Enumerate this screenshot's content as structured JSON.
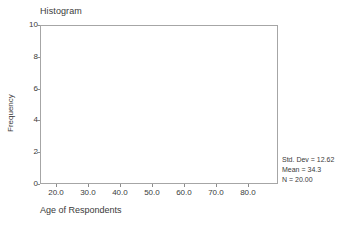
{
  "chart_data": {
    "type": "bar",
    "title": "Histogram",
    "xlabel": "Age of Respondents",
    "ylabel": "Frequency",
    "xlim": [
      15.0,
      89.4
    ],
    "ylim": [
      0,
      10
    ],
    "grid": false,
    "legend": null,
    "x_ticks": [
      "20.0",
      "30.0",
      "40.0",
      "50.0",
      "60.0",
      "70.0",
      "80.0"
    ],
    "x_tick_values": [
      20.0,
      30.0,
      40.0,
      50.0,
      60.0,
      70.0,
      80.0
    ],
    "y_ticks": [
      "0",
      "2",
      "4",
      "6",
      "8",
      "10"
    ],
    "y_tick_values": [
      0,
      2,
      4,
      6,
      8,
      10
    ],
    "categories": [],
    "values": [],
    "annotations": [
      "Std. Dev = 12.62",
      "Mean = 34.3",
      "N = 20.00"
    ]
  },
  "statistics": {
    "std_dev_label": "Std. Dev = 12.62",
    "mean_label": "Mean = 34.3",
    "n_label": "N = 20.00"
  },
  "colors": {
    "frame": "#a6a6a6",
    "tick": "#8c8c8c",
    "text": "#3a3a3a",
    "background": "#ffffff",
    "bar_fill": "#8fa8c8",
    "bar_edge": "#5d7da6"
  }
}
